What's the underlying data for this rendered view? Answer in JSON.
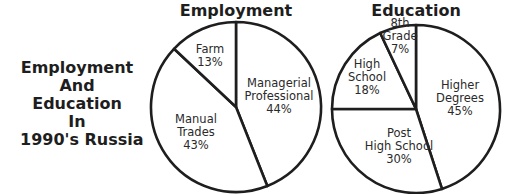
{
  "main_title_lines": [
    "Employment",
    "And",
    "Education",
    "In",
    "1990's Russia"
  ],
  "chart_data": [
    {
      "type": "pie",
      "title": "Employment",
      "start": "top",
      "direction": "clockwise",
      "slices": [
        {
          "label_lines": [
            "Managerial",
            "Professional",
            "44%"
          ],
          "name": "Managerial Professional",
          "value": 44
        },
        {
          "label_lines": [
            "Manual",
            "Trades",
            "43%"
          ],
          "name": "Manual Trades",
          "value": 43
        },
        {
          "label_lines": [
            "Farm",
            "13%"
          ],
          "name": "Farm",
          "value": 13
        }
      ]
    },
    {
      "type": "pie",
      "title": "Education",
      "start": "top",
      "direction": "clockwise",
      "slices": [
        {
          "label_lines": [
            "Higher",
            "Degrees",
            "45%"
          ],
          "name": "Higher Degrees",
          "value": 45
        },
        {
          "label_lines": [
            "Post",
            "High School",
            "30%"
          ],
          "name": "Post High School",
          "value": 30
        },
        {
          "label_lines": [
            "High",
            "School",
            "18%"
          ],
          "name": "High School",
          "value": 18
        },
        {
          "label_lines": [
            "8th",
            "Grade",
            "7%"
          ],
          "name": "8th Grade",
          "value": 7
        }
      ]
    }
  ],
  "colors": {
    "ink": "#1e1e1e",
    "background": "#ffffff"
  }
}
